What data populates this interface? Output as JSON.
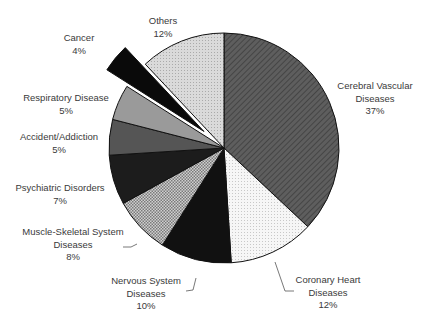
{
  "chart_data": {
    "type": "pie",
    "title": "",
    "start_angle": "12 o'clock",
    "direction": "clockwise",
    "legend": "none (direct labels)",
    "slices": [
      {
        "label": "Cerebral Vascular Diseases",
        "value": 37,
        "display": "37%",
        "fill": "#5a5a5a",
        "pattern": "diagonal-hatch"
      },
      {
        "label": "Coronary Heart Diseases",
        "value": 12,
        "display": "12%",
        "fill": "#f4f4f4",
        "pattern": "fine-dots"
      },
      {
        "label": "Nervous System Diseases",
        "value": 10,
        "display": "10%",
        "fill": "#111111",
        "pattern": "solid"
      },
      {
        "label": "Muscle-Skeletal System Diseases",
        "value": 8,
        "display": "8%",
        "fill": "#bdbdbd",
        "pattern": "checker"
      },
      {
        "label": "Psychiatric Disorders",
        "value": 7,
        "display": "7%",
        "fill": "#1c1c1c",
        "pattern": "solid"
      },
      {
        "label": "Accident/Addiction",
        "value": 5,
        "display": "5%",
        "fill": "#555555",
        "pattern": "solid"
      },
      {
        "label": "Respiratory Disease",
        "value": 5,
        "display": "5%",
        "fill": "#9a9a9a",
        "pattern": "solid"
      },
      {
        "label": "Cancer",
        "value": 4,
        "display": "4%",
        "fill": "#0a0a0a",
        "pattern": "solid",
        "exploded": true
      },
      {
        "label": "Others",
        "value": 12,
        "display": "12%",
        "fill": "#d6d6d6",
        "pattern": "fine-dots"
      }
    ]
  },
  "labels": {
    "cerebral": {
      "line1": "Cerebral Vascular",
      "line2": "Diseases",
      "pct": "37%"
    },
    "coronary": {
      "line1": "Coronary Heart",
      "line2": "Diseases",
      "pct": "12%"
    },
    "nervous": {
      "line1": "Nervous System",
      "line2": "Diseases",
      "pct": "10%"
    },
    "muscle": {
      "line1": "Muscle-Skeletal System",
      "line2": "Diseases",
      "pct": "8%"
    },
    "psychiatric": {
      "line1": "Psychiatric Disorders",
      "pct": "7%"
    },
    "accident": {
      "line1": "Accident/Addiction",
      "pct": "5%"
    },
    "respiratory": {
      "line1": "Respiratory Disease",
      "pct": "5%"
    },
    "cancer": {
      "line1": "Cancer",
      "pct": "4%"
    },
    "others": {
      "line1": "Others",
      "pct": "12%"
    }
  }
}
